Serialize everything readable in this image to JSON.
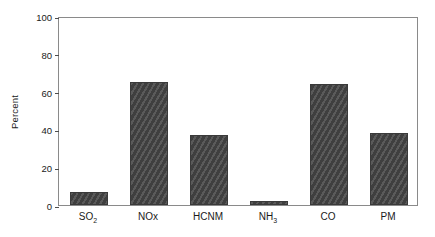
{
  "chart_data": {
    "type": "bar",
    "title": "",
    "xlabel": "",
    "ylabel": "Percent",
    "categories": [
      "SO2",
      "NOx",
      "HCNM",
      "NH3",
      "CO",
      "PM"
    ],
    "category_labels_html": [
      "SO<sub>2</sub>",
      "NOx",
      "HCNM",
      "NH<sub>3</sub>",
      "CO",
      "PM"
    ],
    "category_labels": [
      "SO₂",
      "NOx",
      "HCNM",
      "NH₃",
      "CO",
      "PM"
    ],
    "values": [
      7,
      65,
      37,
      2,
      64,
      38
    ],
    "ylim": [
      0,
      100
    ],
    "yticks": [
      0,
      20,
      40,
      60,
      80,
      100
    ],
    "ytick_labels": [
      "0",
      "20",
      "40",
      "60",
      "80",
      "100"
    ],
    "grid": false,
    "legend": null,
    "bar_color": "#464646",
    "frame_color": "#8a8a8a",
    "background": "#ffffff"
  }
}
